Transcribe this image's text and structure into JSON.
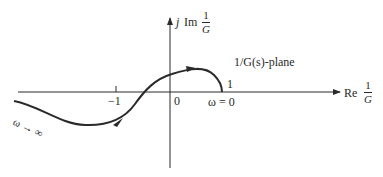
{
  "diagram": {
    "type": "nyquist-plot",
    "plane_label": "1/G(s)-plane",
    "axes": {
      "real": {
        "prefix": "Re",
        "frac_num": "1",
        "frac_den": "G"
      },
      "imag": {
        "prefix": "j",
        "prefix2": "Im",
        "frac_num": "1",
        "frac_den": "G"
      }
    },
    "ticks": {
      "minus_one": "−1",
      "origin": "0",
      "one_on_curve": "1"
    },
    "annotations": {
      "omega_zero": "ω = 0",
      "omega_infinity": "ω → ∞"
    },
    "colors": {
      "ink": "#2a2a2a",
      "background": "#ffffff"
    }
  }
}
